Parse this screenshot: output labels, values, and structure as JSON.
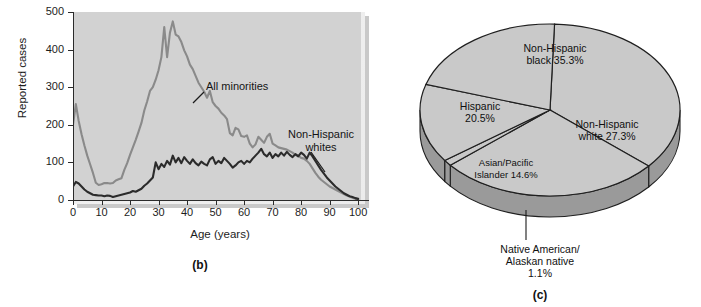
{
  "figure": {
    "panels": [
      {
        "id": "b",
        "caption": "(b)"
      },
      {
        "id": "c",
        "caption": "(c)"
      }
    ]
  },
  "line_panel": {
    "caption": "(b)",
    "ylabel": "Reported cases",
    "xlabel": "Age (years)",
    "annotations": {
      "minorities": "All minorities",
      "whites_line1": "Non-Hispanic",
      "whites_line2": "whites"
    },
    "colors": {
      "plot_background": "#d2d2d2",
      "minorities_line": "#8a8a8a",
      "whites_line": "#2b2b2b",
      "axis": "#2b2b2b"
    }
  },
  "pie_panel": {
    "caption": "(c)",
    "labels": {
      "non_hispanic_black_l1": "Non-Hispanic",
      "non_hispanic_black_l2": "black 35.3%",
      "non_hispanic_white_l1": "Non-Hispanic",
      "non_hispanic_white_l2": "white 27.3%",
      "hispanic_l1": "Hispanic",
      "hispanic_l2": "20.5%",
      "asian_pacific_l1": "Asian/Pacific",
      "asian_pacific_l2": "Islander 14.6%",
      "native_l1": "Native American/",
      "native_l2": "Alaskan native",
      "native_l3": "1.1%"
    },
    "colors": {
      "top_face": "#c9c9c9",
      "side_face": "#9a9a9a",
      "outline": "#1f1f1f"
    }
  },
  "chart_data": [
    {
      "type": "line",
      "title": "",
      "xlabel": "Age (years)",
      "ylabel": "Reported cases",
      "xlim": [
        0,
        101
      ],
      "ylim": [
        0,
        500
      ],
      "xticks": [
        0,
        10,
        20,
        30,
        40,
        50,
        60,
        70,
        80,
        90,
        100
      ],
      "yticks": [
        0,
        100,
        200,
        300,
        400,
        500
      ],
      "grid": false,
      "legend": "inline-annotations",
      "x": [
        0,
        1,
        2,
        3,
        4,
        5,
        6,
        7,
        8,
        9,
        10,
        11,
        12,
        13,
        14,
        15,
        16,
        17,
        18,
        19,
        20,
        21,
        22,
        23,
        24,
        25,
        26,
        27,
        28,
        29,
        30,
        31,
        32,
        33,
        34,
        35,
        36,
        37,
        38,
        39,
        40,
        41,
        42,
        43,
        44,
        45,
        46,
        47,
        48,
        49,
        50,
        51,
        52,
        53,
        54,
        55,
        56,
        57,
        58,
        59,
        60,
        61,
        62,
        63,
        64,
        65,
        66,
        67,
        68,
        69,
        70,
        71,
        72,
        73,
        74,
        75,
        76,
        77,
        78,
        79,
        80,
        81,
        82,
        83,
        84,
        85,
        86,
        87,
        88,
        89,
        90,
        91,
        92,
        93,
        94,
        95,
        96,
        97,
        98,
        99,
        100
      ],
      "series": [
        {
          "name": "All minorities",
          "color": "#8a8a8a",
          "values": [
            200,
            255,
            210,
            175,
            145,
            118,
            95,
            72,
            46,
            40,
            42,
            45,
            45,
            44,
            45,
            52,
            55,
            58,
            80,
            98,
            120,
            140,
            160,
            182,
            205,
            238,
            262,
            290,
            300,
            320,
            345,
            380,
            460,
            380,
            445,
            475,
            440,
            435,
            420,
            398,
            382,
            360,
            348,
            330,
            312,
            300,
            288,
            272,
            290,
            260,
            250,
            243,
            232,
            225,
            215,
            178,
            172,
            192,
            188,
            170,
            168,
            172,
            150,
            140,
            148,
            168,
            160,
            152,
            168,
            176,
            150,
            145,
            140,
            138,
            136,
            134,
            130,
            126,
            120,
            118,
            112,
            110,
            104,
            96,
            84,
            72,
            62,
            54,
            48,
            42,
            36,
            32,
            28,
            24,
            20,
            16,
            12,
            9,
            6,
            3,
            2
          ]
        },
        {
          "name": "Non-Hispanic whites",
          "color": "#2b2b2b",
          "values": [
            36,
            48,
            44,
            36,
            28,
            22,
            18,
            14,
            13,
            12,
            12,
            10,
            12,
            11,
            8,
            10,
            12,
            14,
            16,
            18,
            20,
            24,
            22,
            26,
            30,
            38,
            44,
            52,
            60,
            100,
            82,
            96,
            88,
            104,
            94,
            118,
            100,
            112,
            98,
            114,
            104,
            96,
            108,
            98,
            92,
            102,
            96,
            92,
            108,
            114,
            96,
            104,
            98,
            112,
            104,
            96,
            86,
            92,
            100,
            104,
            96,
            104,
            100,
            110,
            118,
            126,
            136,
            122,
            116,
            126,
            112,
            122,
            116,
            126,
            118,
            128,
            120,
            114,
            122,
            116,
            126,
            120,
            110,
            126,
            116,
            104,
            92,
            80,
            70,
            60,
            52,
            44,
            36,
            30,
            24,
            18,
            14,
            10,
            8,
            5,
            3
          ]
        }
      ]
    },
    {
      "type": "pie",
      "title": "",
      "labels": [
        "Non-Hispanic black",
        "Non-Hispanic white",
        "Native American/Alaskan native",
        "Asian/Pacific Islander",
        "Hispanic"
      ],
      "values": [
        35.3,
        27.3,
        1.1,
        14.6,
        20.5
      ],
      "unit": "%",
      "style": "3d-perspective",
      "colors": [
        "#c9c9c9",
        "#c9c9c9",
        "#c9c9c9",
        "#c9c9c9",
        "#c9c9c9"
      ]
    }
  ]
}
